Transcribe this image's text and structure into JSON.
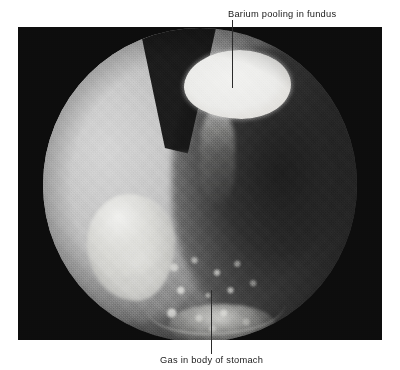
{
  "figure": {
    "modality": "barium-meal-radiograph",
    "background_color": "#ffffff",
    "frame_color": "#0d0d0d",
    "field_shape": "circle"
  },
  "annotations": {
    "top": {
      "label": "Barium pooling in fundus",
      "leader": "vertical-leader-line"
    },
    "bottom": {
      "label": "Gas in body of stomach",
      "leader": "vertical-leader-line"
    }
  },
  "features": {
    "barium_pool_fundus": "barium-pool-fundus",
    "barium_streak": "barium-streak-cardia",
    "barium_loops_left": "barium-filled-bowel-loops",
    "gas_mottle": "mottled-gas-rugal-folds",
    "gas_stomach_body": "gas-filled-stomach-body",
    "left_soft_tissue": "left-soft-tissue-density",
    "top_wedge": "dark-wedge-artifact",
    "greater_curve": "greater-curvature-outline",
    "antral_barium": "antral-barium"
  }
}
